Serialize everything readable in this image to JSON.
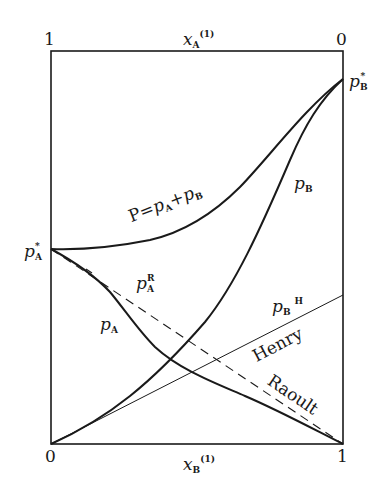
{
  "diagram": {
    "axes": {
      "top": {
        "variable": "x",
        "subscript": "A",
        "superscript": "(1)",
        "left_tick": "1",
        "right_tick": "0"
      },
      "bottom": {
        "variable": "x",
        "subscript": "B",
        "superscript": "(1)",
        "left_tick": "0",
        "right_tick": "1"
      }
    },
    "points": {
      "pA_star": {
        "symbol": "p",
        "subscript": "A",
        "superscript": "*"
      },
      "pB_star": {
        "symbol": "p",
        "subscript": "B",
        "superscript": "*"
      }
    },
    "curve_labels": {
      "total": {
        "lhs": "P",
        "eq": "=",
        "a": "p",
        "a_sub": "A",
        "plus": "+",
        "b": "p",
        "b_sub": "B"
      },
      "pB": {
        "symbol": "p",
        "subscript": "B"
      },
      "pA": {
        "symbol": "p",
        "subscript": "A"
      },
      "pA_R": {
        "symbol": "p",
        "subscript": "A",
        "superscript": "R"
      },
      "pB_H": {
        "symbol": "p",
        "subscript": "B",
        "superscript": "H"
      },
      "henry": "Henry",
      "raoult": "Raoult"
    },
    "curves": [
      {
        "name": "total-pressure-P",
        "style": "solid-thick"
      },
      {
        "name": "partial-pressure-pB",
        "style": "solid-thick"
      },
      {
        "name": "partial-pressure-pA",
        "style": "solid-thick"
      },
      {
        "name": "raoult-line-pA",
        "style": "dashed"
      },
      {
        "name": "henry-line-pB",
        "style": "solid-thin"
      }
    ],
    "colors": {
      "ink": "#1a1a1a",
      "background": "#ffffff"
    }
  }
}
